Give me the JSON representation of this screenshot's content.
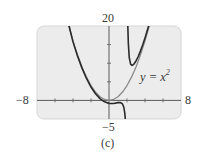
{
  "chart_data": {
    "type": "line",
    "title": "",
    "caption": "(c)",
    "xlabel": "",
    "ylabel": "",
    "xlim": [
      -8,
      8
    ],
    "ylim": [
      -5,
      20
    ],
    "x_tick_step": 2,
    "y_tick_step": 5,
    "axis_labels": {
      "xmin": "−8",
      "xmax": "8",
      "ymin": "−5",
      "ymax": "20"
    },
    "grid": false,
    "legend": null,
    "annotations": [
      {
        "text": "y = x²",
        "x": 5.5,
        "y": 7.5
      }
    ],
    "series": [
      {
        "name": "y = x^2",
        "color": "#8a8a8a",
        "points": [
          [
            -4.47,
            20
          ],
          [
            -4,
            16
          ],
          [
            -3.5,
            12.25
          ],
          [
            -3,
            9
          ],
          [
            -2.5,
            6.25
          ],
          [
            -2,
            4
          ],
          [
            -1.5,
            2.25
          ],
          [
            -1,
            1
          ],
          [
            -0.5,
            0.25
          ],
          [
            0,
            0
          ],
          [
            0.5,
            0.25
          ],
          [
            1,
            1
          ],
          [
            1.5,
            2.25
          ],
          [
            2,
            4
          ],
          [
            2.5,
            6.25
          ],
          [
            3,
            9
          ],
          [
            3.5,
            12.25
          ],
          [
            4,
            16
          ],
          [
            4.47,
            20
          ]
        ]
      },
      {
        "name": "f(x) left branch",
        "color": "#2b2b2b",
        "points": [
          [
            -4.43,
            20
          ],
          [
            -4,
            15.73
          ],
          [
            -3.5,
            11.96
          ],
          [
            -3,
            8.68
          ],
          [
            -2.5,
            5.89
          ],
          [
            -2,
            3.6
          ],
          [
            -1.5,
            1.79
          ],
          [
            -1,
            0.47
          ],
          [
            -0.5,
            -0.39
          ],
          [
            0,
            -0.8
          ],
          [
            0.5,
            -0.82
          ],
          [
            1,
            -0.6
          ],
          [
            1.25,
            -0.57
          ],
          [
            1.5,
            -0.95
          ],
          [
            1.65,
            -1.85
          ],
          [
            1.75,
            -3.34
          ],
          [
            1.81,
            -5
          ]
        ]
      },
      {
        "name": "f(x) right branch",
        "color": "#2b2b2b",
        "points": [
          [
            2.09,
            20
          ],
          [
            2.15,
            15.3
          ],
          [
            2.25,
            11.5
          ],
          [
            2.4,
            9.76
          ],
          [
            2.56,
            9.4
          ],
          [
            2.75,
            9.7
          ],
          [
            3,
            10.6
          ],
          [
            3.25,
            11.8
          ],
          [
            3.5,
            13.32
          ],
          [
            3.75,
            14.98
          ],
          [
            4,
            16.8
          ],
          [
            4.2,
            18.37
          ],
          [
            4.4,
            20
          ]
        ]
      }
    ]
  },
  "plot": {
    "background": "#ececec",
    "border": "#d6d6d6",
    "axis_color": "#5a5a5a"
  }
}
